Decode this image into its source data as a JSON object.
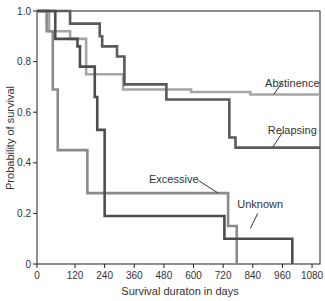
{
  "chart_data": {
    "type": "line",
    "subtype": "kaplan-meier step",
    "title": "",
    "xlabel": "Survival duraton in days",
    "ylabel": "Probability of survival",
    "xlim": [
      -30,
      1110
    ],
    "ylim": [
      0,
      1.0
    ],
    "x_ticks": [
      0,
      120,
      240,
      360,
      480,
      600,
      720,
      840,
      960,
      1080
    ],
    "y_ticks": [
      0,
      0.2,
      0.4,
      0.6,
      0.8,
      1.0
    ],
    "y_tick_labels": [
      "0",
      "0.2",
      "0.4",
      "0.6",
      "0.8",
      "1.0"
    ],
    "grid": false,
    "legend": "inline labels",
    "series": [
      {
        "name": "Abstinence",
        "color": "#a6a6a6",
        "steps": [
          [
            0,
            1.0
          ],
          [
            15,
            0.92
          ],
          [
            100,
            0.89
          ],
          [
            165,
            0.75
          ],
          [
            315,
            0.69
          ],
          [
            590,
            0.68
          ],
          [
            830,
            0.67
          ],
          [
            1110,
            0.67
          ]
        ],
        "label_pos": [
          1000,
          0.7
        ],
        "leader": [
          [
            925,
            0.67
          ],
          [
            960,
            0.72
          ]
        ]
      },
      {
        "name": "Relapsing",
        "color": "#5a5a5a",
        "steps": [
          [
            0,
            1.0
          ],
          [
            100,
            0.95
          ],
          [
            220,
            0.9
          ],
          [
            230,
            0.86
          ],
          [
            290,
            0.82
          ],
          [
            320,
            0.71
          ],
          [
            490,
            0.65
          ],
          [
            745,
            0.5
          ],
          [
            770,
            0.46
          ],
          [
            1110,
            0.46
          ]
        ],
        "label_pos": [
          1000,
          0.515
        ],
        "leader": [
          [
            920,
            0.46
          ],
          [
            960,
            0.52
          ]
        ]
      },
      {
        "name": "Excessive",
        "color": "#8a8a8a",
        "steps": [
          [
            0,
            1.0
          ],
          [
            5,
            0.92
          ],
          [
            30,
            0.69
          ],
          [
            50,
            0.45
          ],
          [
            170,
            0.28
          ],
          [
            740,
            0.15
          ],
          [
            775,
            0.0
          ]
        ],
        "label_pos": [
          520,
          0.32
        ],
        "leader": [
          [
            620,
            0.33
          ],
          [
            700,
            0.28
          ]
        ]
      },
      {
        "name": "Unknown",
        "color": "#4d4d4d",
        "steps": [
          [
            0,
            1.0
          ],
          [
            40,
            0.89
          ],
          [
            130,
            0.86
          ],
          [
            140,
            0.78
          ],
          [
            200,
            0.66
          ],
          [
            210,
            0.53
          ],
          [
            240,
            0.19
          ],
          [
            725,
            0.1
          ],
          [
            1000,
            0.0
          ]
        ],
        "label_pos": [
          870,
          0.22
        ],
        "leader": [
          [
            860,
            0.2
          ],
          [
            830,
            0.14
          ]
        ]
      }
    ]
  }
}
